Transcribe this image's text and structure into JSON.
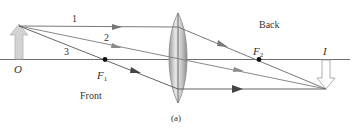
{
  "diagram": {
    "caption": "(a)",
    "labels": {
      "object": "O",
      "image": "I",
      "focal_front": "F",
      "focal_front_sub": "1",
      "focal_back": "F",
      "focal_back_sub": "2",
      "front": "Front",
      "back": "Back",
      "ray1": "1",
      "ray2": "2",
      "ray3": "3"
    },
    "colors": {
      "axis": "#6f6f6f",
      "ray": "#6a6a6a",
      "arrowhead": "#505050",
      "object_arrow": "#cfcfcf",
      "lens_fill": "#b9b9b9",
      "text": "#333333"
    }
  }
}
